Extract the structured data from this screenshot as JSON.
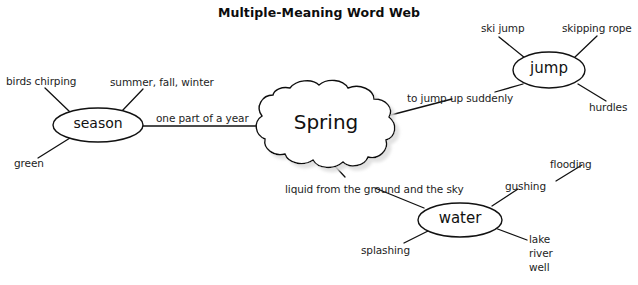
{
  "title": "Multiple-Meaning Word Web",
  "colors": {
    "background": "#ffffff",
    "stroke": "#111111",
    "text": "#1a1a1a",
    "shadow": "#b9b9b9"
  },
  "center_node": {
    "label": "Spring",
    "shape": "cloud"
  },
  "meaning_nodes": [
    {
      "id": "season",
      "label": "season",
      "shape": "ellipse",
      "connector_label": "one part of a year",
      "associations": [
        {
          "id": "birds-chirping",
          "label": "birds chirping"
        },
        {
          "id": "summer-fall-winter",
          "label": "summer, fall, winter"
        },
        {
          "id": "green",
          "label": "green"
        }
      ]
    },
    {
      "id": "jump",
      "label": "jump",
      "shape": "ellipse",
      "connector_label": "to jump up suddenly",
      "associations": [
        {
          "id": "ski-jump",
          "label": "ski jump"
        },
        {
          "id": "skipping-rope",
          "label": "skipping rope"
        },
        {
          "id": "hurdles",
          "label": "hurdles"
        }
      ]
    },
    {
      "id": "water",
      "label": "water",
      "shape": "ellipse",
      "connector_label": "liquid from the ground and the sky",
      "associations": [
        {
          "id": "gushing",
          "label": "gushing"
        },
        {
          "id": "flooding",
          "label": "flooding"
        },
        {
          "id": "splashing",
          "label": "splashing"
        },
        {
          "id": "lake-river-well",
          "label": "lake\nriver\nwell"
        }
      ]
    }
  ]
}
